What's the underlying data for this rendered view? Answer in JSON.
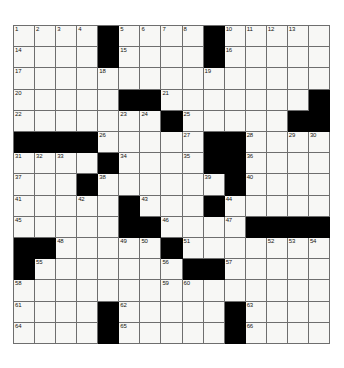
{
  "puzzle": {
    "title": "Crossword Grid",
    "rows": 15,
    "cols": 15,
    "colors": {
      "block": "#000000",
      "cell": "#f7f7f5",
      "grid_line": "#6e6e6e",
      "number": "#15150f",
      "background": "#ffffff"
    },
    "blocks": [
      [
        0,
        4
      ],
      [
        0,
        9
      ],
      [
        1,
        4
      ],
      [
        1,
        9
      ],
      [
        3,
        5
      ],
      [
        3,
        6
      ],
      [
        3,
        14
      ],
      [
        4,
        7
      ],
      [
        4,
        13
      ],
      [
        4,
        14
      ],
      [
        5,
        0
      ],
      [
        5,
        1
      ],
      [
        5,
        2
      ],
      [
        5,
        3
      ],
      [
        5,
        9
      ],
      [
        5,
        10
      ],
      [
        6,
        4
      ],
      [
        6,
        9
      ],
      [
        6,
        10
      ],
      [
        7,
        3
      ],
      [
        7,
        10
      ],
      [
        8,
        5
      ],
      [
        8,
        9
      ],
      [
        9,
        5
      ],
      [
        9,
        6
      ],
      [
        9,
        11
      ],
      [
        9,
        12
      ],
      [
        9,
        13
      ],
      [
        9,
        14
      ],
      [
        10,
        0
      ],
      [
        10,
        1
      ],
      [
        10,
        7
      ],
      [
        11,
        0
      ],
      [
        11,
        8
      ],
      [
        11,
        9
      ],
      [
        13,
        4
      ],
      [
        13,
        10
      ],
      [
        14,
        4
      ],
      [
        14,
        10
      ]
    ],
    "numbers": [
      {
        "r": 0,
        "c": 0,
        "n": "1"
      },
      {
        "r": 0,
        "c": 1,
        "n": "2"
      },
      {
        "r": 0,
        "c": 2,
        "n": "3"
      },
      {
        "r": 0,
        "c": 3,
        "n": "4"
      },
      {
        "r": 0,
        "c": 5,
        "n": "5"
      },
      {
        "r": 0,
        "c": 6,
        "n": "6"
      },
      {
        "r": 0,
        "c": 7,
        "n": "7"
      },
      {
        "r": 0,
        "c": 8,
        "n": "8"
      },
      {
        "r": 0,
        "c": 9,
        "n": "9"
      },
      {
        "r": 0,
        "c": 10,
        "n": "10"
      },
      {
        "r": 0,
        "c": 11,
        "n": "11"
      },
      {
        "r": 0,
        "c": 12,
        "n": "12"
      },
      {
        "r": 0,
        "c": 13,
        "n": "13"
      },
      {
        "r": 1,
        "c": 0,
        "n": "14"
      },
      {
        "r": 1,
        "c": 5,
        "n": "15"
      },
      {
        "r": 1,
        "c": 10,
        "n": "16"
      },
      {
        "r": 2,
        "c": 0,
        "n": "17"
      },
      {
        "r": 2,
        "c": 4,
        "n": "18"
      },
      {
        "r": 2,
        "c": 9,
        "n": "19"
      },
      {
        "r": 3,
        "c": 0,
        "n": "20"
      },
      {
        "r": 3,
        "c": 7,
        "n": "21"
      },
      {
        "r": 4,
        "c": 0,
        "n": "22"
      },
      {
        "r": 4,
        "c": 5,
        "n": "23"
      },
      {
        "r": 4,
        "c": 6,
        "n": "24"
      },
      {
        "r": 4,
        "c": 8,
        "n": "25"
      },
      {
        "r": 5,
        "c": 4,
        "n": "26"
      },
      {
        "r": 5,
        "c": 8,
        "n": "27"
      },
      {
        "r": 5,
        "c": 11,
        "n": "28"
      },
      {
        "r": 5,
        "c": 13,
        "n": "29"
      },
      {
        "r": 5,
        "c": 14,
        "n": "30"
      },
      {
        "r": 6,
        "c": 0,
        "n": "31"
      },
      {
        "r": 6,
        "c": 1,
        "n": "32"
      },
      {
        "r": 6,
        "c": 2,
        "n": "33"
      },
      {
        "r": 6,
        "c": 5,
        "n": "34"
      },
      {
        "r": 6,
        "c": 8,
        "n": "35"
      },
      {
        "r": 6,
        "c": 11,
        "n": "36"
      },
      {
        "r": 7,
        "c": 0,
        "n": "37"
      },
      {
        "r": 7,
        "c": 4,
        "n": "38"
      },
      {
        "r": 7,
        "c": 9,
        "n": "39"
      },
      {
        "r": 7,
        "c": 11,
        "n": "40"
      },
      {
        "r": 8,
        "c": 0,
        "n": "41"
      },
      {
        "r": 8,
        "c": 3,
        "n": "42"
      },
      {
        "r": 8,
        "c": 6,
        "n": "43"
      },
      {
        "r": 8,
        "c": 10,
        "n": "44"
      },
      {
        "r": 9,
        "c": 0,
        "n": "45"
      },
      {
        "r": 9,
        "c": 7,
        "n": "46"
      },
      {
        "r": 9,
        "c": 10,
        "n": "47"
      },
      {
        "r": 10,
        "c": 2,
        "n": "48"
      },
      {
        "r": 10,
        "c": 5,
        "n": "49"
      },
      {
        "r": 10,
        "c": 6,
        "n": "50"
      },
      {
        "r": 10,
        "c": 8,
        "n": "51"
      },
      {
        "r": 10,
        "c": 12,
        "n": "52"
      },
      {
        "r": 10,
        "c": 13,
        "n": "53"
      },
      {
        "r": 10,
        "c": 14,
        "n": "54"
      },
      {
        "r": 11,
        "c": 1,
        "n": "55"
      },
      {
        "r": 11,
        "c": 7,
        "n": "56"
      },
      {
        "r": 11,
        "c": 10,
        "n": "57"
      },
      {
        "r": 12,
        "c": 0,
        "n": "58"
      },
      {
        "r": 12,
        "c": 7,
        "n": "59"
      },
      {
        "r": 12,
        "c": 8,
        "n": "60"
      },
      {
        "r": 13,
        "c": 0,
        "n": "61"
      },
      {
        "r": 13,
        "c": 5,
        "n": "62"
      },
      {
        "r": 13,
        "c": 11,
        "n": "63"
      },
      {
        "r": 14,
        "c": 0,
        "n": "64"
      },
      {
        "r": 14,
        "c": 5,
        "n": "65"
      },
      {
        "r": 14,
        "c": 11,
        "n": "66"
      }
    ],
    "letters": []
  }
}
